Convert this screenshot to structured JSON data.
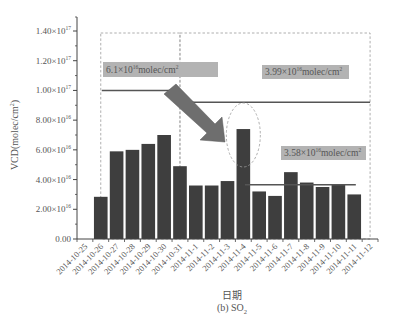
{
  "chart_data": {
    "type": "bar",
    "title": "",
    "subtitle": "(b) SO",
    "subtitle_subscript": "2",
    "xlabel": "日期",
    "ylabel": "VCD(molec/cm",
    "ylabel_sup": "2",
    "ylabel_close": ")",
    "ylim": [
      0,
      1.4e+17
    ],
    "grid": false,
    "categories": [
      "2014-10-25",
      "2014-10-26",
      "2014-10-27",
      "2014-10-28",
      "2014-10-29",
      "2014-10-30",
      "2014-10-31",
      "2014-11-1",
      "2014-11-2",
      "2014-11-3",
      "2014-11-4",
      "2014-11-5",
      "2014-11-6",
      "2014-11-7",
      "2014-11-8",
      "2014-11-9",
      "2014-11-10",
      "2014-11-11",
      "2014-11-12"
    ],
    "values": [
      null,
      2.84e+16,
      5.9e+16,
      6e+16,
      6.4e+16,
      7e+16,
      4.9e+16,
      3.6e+16,
      3.6e+16,
      3.9e+16,
      7.4e+16,
      3.2e+16,
      2.9e+16,
      4.5e+16,
      3.8e+16,
      3.5e+16,
      3.7e+16,
      3e+16,
      null
    ],
    "yticks": [
      {
        "value": 0,
        "label": "0.00"
      },
      {
        "value": 2e+16,
        "label": "2.00×10",
        "exp": "16"
      },
      {
        "value": 4e+16,
        "label": "4.00×10",
        "exp": "16"
      },
      {
        "value": 6e+16,
        "label": "6.00×10",
        "exp": "16"
      },
      {
        "value": 8e+16,
        "label": "8.00×10",
        "exp": "16"
      },
      {
        "value": 1e+17,
        "label": "1.00×10",
        "exp": "17"
      },
      {
        "value": 1.2e+17,
        "label": "1.20×10",
        "exp": "17"
      },
      {
        "value": 1.4e+17,
        "label": "1.40×10",
        "exp": "17"
      }
    ],
    "annotations": [
      {
        "type": "mean-line",
        "label": "6.1×10",
        "exp": "16",
        "unit": "molec/cm",
        "unit_sup": "2",
        "value": 1e+17,
        "from_index": 1.5,
        "to_index": 6.5
      },
      {
        "type": "mean-line",
        "label": "3.99×10",
        "exp": "16",
        "unit": "molec/cm",
        "unit_sup": "2",
        "value": 9.2e+16,
        "from_index": 6.5,
        "to_index": 18.5
      },
      {
        "type": "mean-line",
        "label": "3.58×10",
        "exp": "16",
        "unit": "molec/cm",
        "unit_sup": "2",
        "value": 3.65e+16,
        "from_index": 10.6,
        "to_index": 17.6
      },
      {
        "type": "dashed-box",
        "from_index": 1.5,
        "to_index": 6.5
      },
      {
        "type": "dashed-box",
        "from_index": 6.5,
        "to_index": 18.5
      },
      {
        "type": "arrow",
        "direction": "down-right",
        "color": "#6e6e6e"
      },
      {
        "type": "dashed-ellipse",
        "around_index": 10
      }
    ],
    "colors": {
      "bar": "#3e3e3e",
      "axis": "#444444",
      "mean_line": "#555555",
      "label_bg": "#b3b3b3",
      "arrow": "#6e6e6e",
      "dashed": "#9a9a9a"
    }
  }
}
